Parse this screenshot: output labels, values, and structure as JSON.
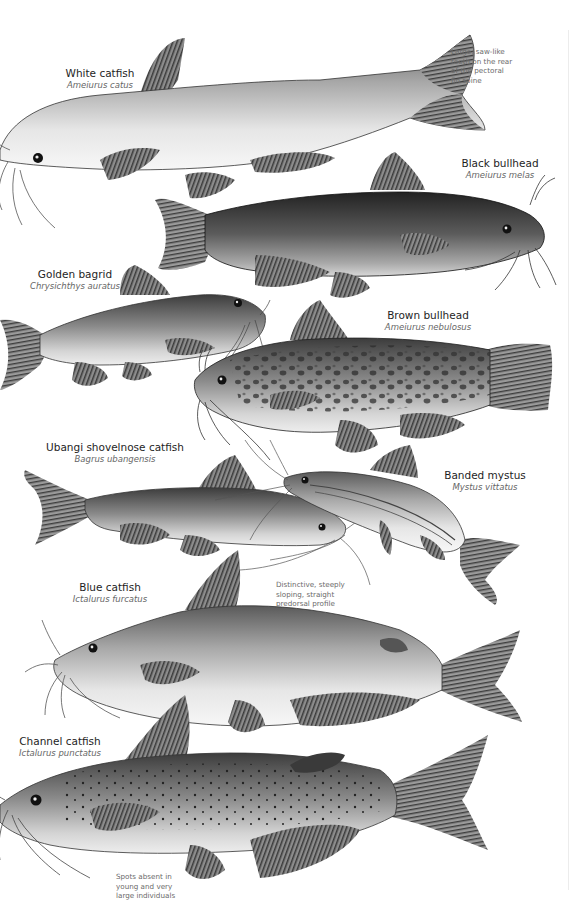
{
  "page": {
    "background": "#ffffff",
    "text_color": "#1e1e1e",
    "scientific_color": "#666666",
    "note_color": "#6a6a6a"
  },
  "species": [
    {
      "id": "white-catfish",
      "common": "White catfish",
      "scientific": "Ameiurus catus"
    },
    {
      "id": "black-bullhead",
      "common": "Black bullhead",
      "scientific": "Ameiurus melas"
    },
    {
      "id": "golden-bagrid",
      "common": "Golden bagrid",
      "scientific": "Chrysichthys auratus"
    },
    {
      "id": "brown-bullhead",
      "common": "Brown bullhead",
      "scientific": "Ameiurus nebulosus"
    },
    {
      "id": "ubangi-shovelnose-catfish",
      "common": "Ubangi shovelnose catfish",
      "scientific": "Bagrus ubangensis"
    },
    {
      "id": "banded-mystus",
      "common": "Banded mystus",
      "scientific": "Mystus vittatus"
    },
    {
      "id": "blue-catfish",
      "common": "Blue catfish",
      "scientific": "Ictalurus furcatus"
    },
    {
      "id": "channel-catfish",
      "common": "Channel catfish",
      "scientific": "Ictalurus punctatus"
    }
  ],
  "notes": {
    "white_catfish": [
      "Large, saw-like",
      "teeth on the rear",
      "of the pectoral",
      "fin spine"
    ],
    "blue_catfish": [
      "Distinctive, steeply",
      "sloping, straight",
      "predorsal profile"
    ],
    "channel_catfish": [
      "Spots absent in",
      "young and very",
      "large individuals"
    ]
  }
}
